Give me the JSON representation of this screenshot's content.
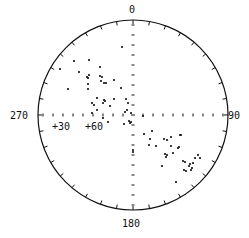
{
  "chart_data": {
    "type": "scatter",
    "subtype": "polar stereonet (equal-area plot)",
    "title": "",
    "direction_labels": {
      "north": "0",
      "east": "90",
      "south": "180",
      "west": "270"
    },
    "radial_labels": [
      "+30",
      "+60"
    ],
    "axis_ticks": "tick marks every 10° around the rim and along the N-S and E-W diameters",
    "grid": false,
    "legend": null,
    "center_px": [
      133,
      115
    ],
    "radius_px": 95,
    "points_px": [
      [
        74,
        61
      ],
      [
        89,
        60
      ],
      [
        60,
        69
      ],
      [
        79,
        72
      ],
      [
        100,
        67
      ],
      [
        87,
        77
      ],
      [
        88,
        78
      ],
      [
        89,
        75
      ],
      [
        100,
        76
      ],
      [
        102,
        77
      ],
      [
        114,
        80
      ],
      [
        88,
        84
      ],
      [
        101,
        81
      ],
      [
        104,
        83
      ],
      [
        106,
        83
      ],
      [
        68,
        89
      ],
      [
        88,
        89
      ],
      [
        121,
        88
      ],
      [
        97,
        98
      ],
      [
        104,
        100
      ],
      [
        105,
        101
      ],
      [
        103,
        103
      ],
      [
        114,
        99
      ],
      [
        126,
        99
      ],
      [
        92,
        103
      ],
      [
        110,
        106
      ],
      [
        94,
        105
      ],
      [
        128,
        103
      ],
      [
        97,
        110
      ],
      [
        127,
        110
      ],
      [
        125,
        112
      ],
      [
        131,
        113
      ],
      [
        92,
        113
      ],
      [
        103,
        118
      ],
      [
        108,
        122
      ],
      [
        129,
        121
      ],
      [
        131,
        122
      ],
      [
        124,
        124
      ],
      [
        130,
        123
      ],
      [
        143,
        116
      ],
      [
        152,
        131
      ],
      [
        144,
        134
      ],
      [
        150,
        139
      ],
      [
        156,
        146
      ],
      [
        149,
        145
      ],
      [
        164,
        139
      ],
      [
        167,
        140
      ],
      [
        171,
        137
      ],
      [
        171,
        146
      ],
      [
        178,
        148
      ],
      [
        180,
        135
      ],
      [
        181,
        135
      ],
      [
        165,
        154
      ],
      [
        167,
        155
      ],
      [
        173,
        153
      ],
      [
        166,
        157
      ],
      [
        162,
        166
      ],
      [
        183,
        161
      ],
      [
        185,
        162
      ],
      [
        179,
        147
      ],
      [
        198,
        155
      ],
      [
        195,
        158
      ],
      [
        200,
        158
      ],
      [
        193,
        163
      ],
      [
        190,
        164
      ],
      [
        189,
        166
      ],
      [
        186,
        171
      ],
      [
        192,
        168
      ],
      [
        184,
        170
      ],
      [
        191,
        170
      ],
      [
        176,
        182
      ],
      [
        133,
        150
      ],
      [
        133,
        152
      ],
      [
        122,
        47
      ]
    ]
  }
}
